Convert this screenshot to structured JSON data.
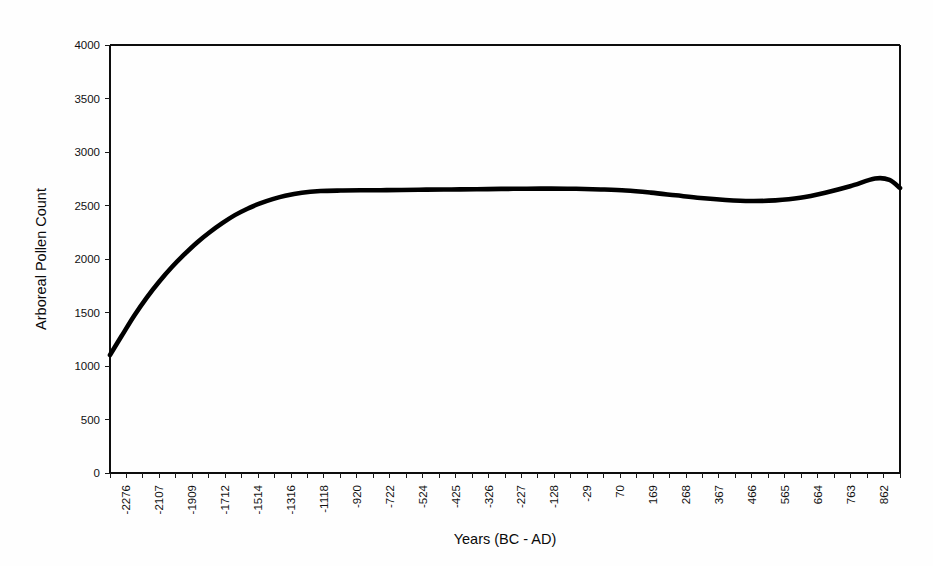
{
  "chart_data": {
    "type": "line",
    "title": "",
    "xlabel": "Years (BC - AD)",
    "ylabel": "Arboreal Pollen Count",
    "xlim": [
      -2276,
      862
    ],
    "ylim": [
      0,
      4000
    ],
    "grid": false,
    "legend": null,
    "y_ticks": [
      0,
      500,
      1000,
      1500,
      2000,
      2500,
      3000,
      3500,
      4000
    ],
    "y_tick_labels": [
      "0",
      "500",
      "1000",
      "1500",
      "2000",
      "2500",
      "3000",
      "3500",
      "4000"
    ],
    "x_tick_labels": [
      "-2276",
      "-2107",
      "-1909",
      "-1712",
      "-1514",
      "-1316",
      "-1118",
      "-920",
      "-722",
      "-524",
      "-425",
      "-326",
      "-227",
      "-128",
      "-29",
      "70",
      "169",
      "268",
      "367",
      "466",
      "565",
      "664",
      "763",
      "862"
    ],
    "series": [
      {
        "name": "Arboreal Pollen Count",
        "color": "#000000",
        "x": [
          -2276,
          -2230,
          -2180,
          -2130,
          -2080,
          -2030,
          -1980,
          -1930,
          -1880,
          -1830,
          -1780,
          -1730,
          -1680,
          -1630,
          -1580,
          -1514,
          -1440,
          -1360,
          -1280,
          -1200,
          -1118,
          -1020,
          -920,
          -820,
          -722,
          -620,
          -524,
          -425,
          -326,
          -227,
          -128,
          -29,
          70,
          169,
          268,
          367,
          466,
          565,
          664,
          763,
          820,
          862
        ],
        "y": [
          1103,
          1280,
          1470,
          1640,
          1790,
          1925,
          2045,
          2155,
          2250,
          2335,
          2410,
          2470,
          2520,
          2560,
          2592,
          2620,
          2635,
          2640,
          2642,
          2643,
          2645,
          2648,
          2650,
          2652,
          2655,
          2657,
          2658,
          2656,
          2650,
          2640,
          2620,
          2595,
          2570,
          2552,
          2542,
          2548,
          2572,
          2620,
          2680,
          2752,
          2740,
          2663
        ]
      }
    ]
  },
  "axes": {
    "y_title": "Arboreal Pollen Count",
    "x_title": "Years (BC - AD)"
  }
}
